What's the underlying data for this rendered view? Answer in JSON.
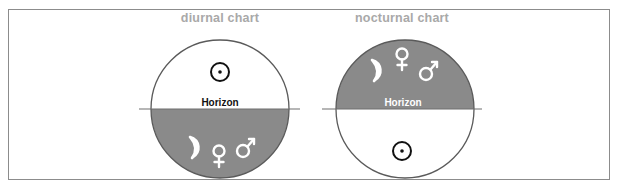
{
  "colors": {
    "frame_border": "#8c8c8c",
    "title_text": "#a9a9a9",
    "below_horizon_fill": "#8a8a8a",
    "above_horizon_fill": "#ffffff",
    "circle_outline": "#5a5a5a",
    "horizon_line": "#6e6e6e"
  },
  "charts": [
    {
      "title": "diurnal chart",
      "horizon_label": "Horizon",
      "above_horizon": [
        "sun"
      ],
      "below_horizon": [
        "moon",
        "venus",
        "mars"
      ],
      "shaded_half": "lower"
    },
    {
      "title": "nocturnal chart",
      "horizon_label": "Horizon",
      "above_horizon": [
        "moon",
        "venus",
        "mars"
      ],
      "below_horizon": [
        "sun"
      ],
      "shaded_half": "upper"
    }
  ]
}
